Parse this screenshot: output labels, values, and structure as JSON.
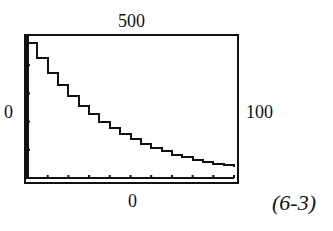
{
  "figure_label": "(6-3)",
  "window": {
    "xmin_label": "0",
    "xmax_label": "100",
    "ymin_label": "0",
    "ymax_label": "500"
  },
  "chart_data": {
    "type": "line",
    "title": "",
    "xlabel": "",
    "ylabel": "",
    "xlim": [
      0,
      100
    ],
    "ylim": [
      0,
      500
    ],
    "x_tick_step": 10,
    "y_tick_step": 100,
    "grid": false,
    "legend": null,
    "annotations": [
      "(6-3)"
    ],
    "series": [
      {
        "name": "exponential decay",
        "x": [
          0,
          5,
          10,
          15,
          20,
          25,
          30,
          35,
          40,
          45,
          50,
          55,
          60,
          65,
          70,
          75,
          80,
          85,
          90,
          95,
          100
        ],
        "values": [
          480,
          424,
          374,
          330,
          291,
          257,
          227,
          200,
          177,
          156,
          138,
          121,
          107,
          95,
          83,
          74,
          65,
          57,
          51,
          45,
          39
        ]
      }
    ]
  },
  "colors": {
    "line": "#111111",
    "frame": "#111111",
    "background": "#ffffff"
  }
}
